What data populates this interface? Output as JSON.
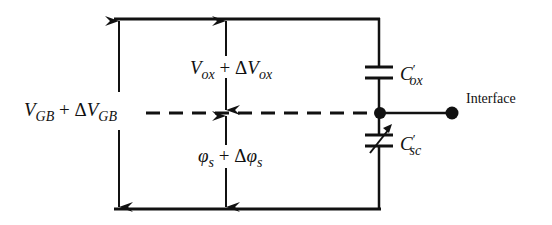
{
  "diagram": {
    "labels": {
      "vgb": {
        "main": "V",
        "sub": "GB",
        "plus": "+",
        "delta": "Δ",
        "main2": "V",
        "sub2": "GB"
      },
      "vox": {
        "main": "V",
        "sub": "ox",
        "plus": "+",
        "delta": "Δ",
        "main2": "V",
        "sub2": "ox"
      },
      "phis": {
        "main": "φ",
        "sub": "s",
        "plus": "+",
        "delta": "Δ",
        "main2": "φ",
        "sub2": "s"
      },
      "cox": {
        "main": "C",
        "prime": "′",
        "sub": "ox"
      },
      "csc": {
        "main": "C",
        "prime": "′",
        "sub": "sc"
      },
      "interface": "Interface"
    },
    "components": [
      {
        "id": "cox",
        "type": "capacitor",
        "name": "C'ox"
      },
      {
        "id": "csc",
        "type": "variable-capacitor",
        "name": "C'sc"
      }
    ],
    "colors": {
      "line": "#111111",
      "background": "#ffffff"
    }
  }
}
